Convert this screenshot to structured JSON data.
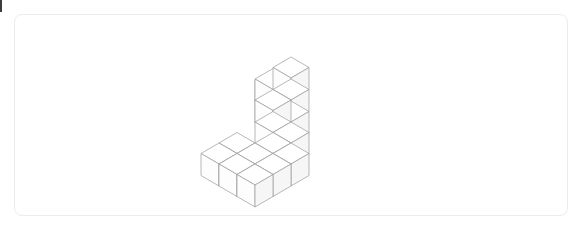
{
  "page": {
    "background_color": "#ffffff",
    "width": 584,
    "height": 230
  },
  "edge_marker": {
    "name": "left-edge-sliver",
    "color": "#3c3c3c",
    "label": ""
  },
  "card": {
    "name": "figure-card",
    "background_color": "#ffffff",
    "border_color": "#ececec",
    "border_radius_px": 8,
    "x": 14,
    "y": 14,
    "width": 554,
    "height": 202,
    "title": "",
    "caption": ""
  },
  "figure": {
    "name": "isometric-cube-structure",
    "type": "isometric-voxel-wireframe",
    "cube_count": 17,
    "stroke_color": "#9a9a9a",
    "face_top_color": "#ffffff",
    "face_left_color": "#fdfdfd",
    "face_right_color": "#f6f6f6",
    "stroke_width": 0.7,
    "projection": {
      "half_width": 18,
      "half_height": 10.5,
      "cube_height": 22,
      "origin_x": 276,
      "origin_y": 86
    },
    "voxels": [
      {
        "x": 0,
        "y": 0,
        "z": 2
      },
      {
        "x": -1,
        "y": 0,
        "z": 1
      },
      {
        "x": 0,
        "y": 0,
        "z": 1
      },
      {
        "x": 0,
        "y": 1,
        "z": 1
      },
      {
        "x": -1,
        "y": 0,
        "z": 0
      },
      {
        "x": 0,
        "y": 0,
        "z": 0
      },
      {
        "x": 0,
        "y": 1,
        "z": 0
      },
      {
        "x": -2,
        "y": -1,
        "z": 0
      },
      {
        "x": 1,
        "y": 1,
        "z": 0
      },
      {
        "x": 1,
        "y": 2,
        "z": 0
      },
      {
        "x": 2,
        "y": 2,
        "z": 0
      },
      {
        "x": 1,
        "y": 3,
        "z": 0
      },
      {
        "x": 2,
        "y": 3,
        "z": 0
      },
      {
        "x": 0,
        "y": 3,
        "z": 0
      },
      {
        "x": 2,
        "y": 4,
        "z": 0
      },
      {
        "x": 1,
        "y": 4,
        "z": 0
      },
      {
        "x": 0,
        "y": 4,
        "z": 0
      }
    ]
  }
}
